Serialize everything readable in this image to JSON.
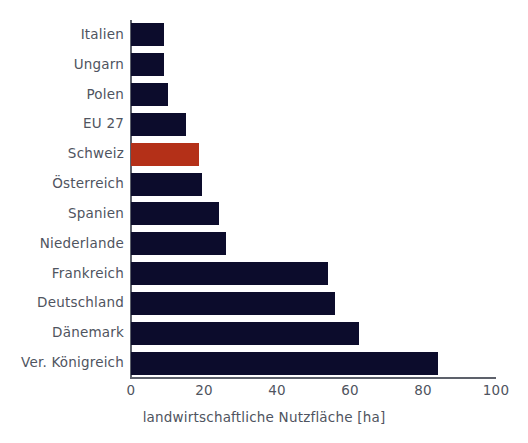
{
  "chart_data": {
    "type": "bar",
    "orientation": "horizontal",
    "title": "",
    "xlabel": "landwirtschaftliche Nutzfläche [ha]",
    "ylabel": "",
    "xlim": [
      0,
      100
    ],
    "xticks": [
      0,
      20,
      40,
      60,
      80,
      100
    ],
    "grid": false,
    "legend": "none",
    "categories": [
      "Italien",
      "Ungarn",
      "Polen",
      "EU 27",
      "Schweiz",
      "Österreich",
      "Spanien",
      "Niederlande",
      "Frankreich",
      "Deutschland",
      "Dänemark",
      "Ver. Königreich"
    ],
    "values": [
      9,
      9,
      10,
      15,
      18.5,
      19.5,
      24,
      26,
      54,
      56,
      62.5,
      84
    ],
    "bar_colors": [
      "#0c0c2c",
      "#0c0c2c",
      "#0c0c2c",
      "#0c0c2c",
      "#b43018",
      "#0c0c2c",
      "#0c0c2c",
      "#0c0c2c",
      "#0c0c2c",
      "#0c0c2c",
      "#0c0c2c",
      "#0c0c2c"
    ],
    "highlight_category": "Schweiz",
    "colors": {
      "bar_default": "#0c0c2c",
      "bar_highlight": "#b43018",
      "axis": "#5d616b",
      "text": "#4f5460",
      "background": "#ffffff"
    }
  }
}
